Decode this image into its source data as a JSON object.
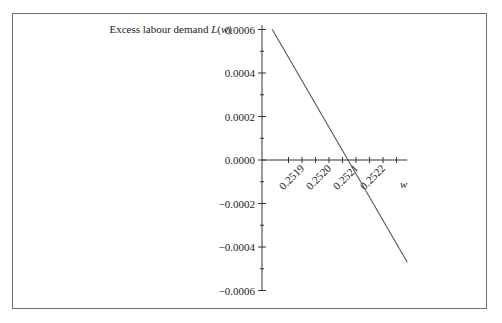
{
  "chart_data": {
    "type": "line",
    "title": "",
    "ylabel": "Excess labour demand L(w)",
    "ylabel_parts": {
      "text": "Excess labour demand ",
      "italic": "L",
      "paren_open": "(",
      "var": "w",
      "paren_close": ")"
    },
    "xlabel": "w",
    "x_ticks": [
      "0.2519",
      "0.2520",
      "0.2521",
      "0.2522"
    ],
    "x_tick_values": [
      0.2519,
      0.252,
      0.2521,
      0.2522
    ],
    "y_ticks": [
      "0.0006",
      "0.0004",
      "0.0002",
      "0.0000",
      "−0.0002",
      "−0.0004",
      "−0.0006"
    ],
    "y_tick_values": [
      0.0006,
      0.0004,
      0.0002,
      0.0,
      -0.0002,
      -0.0004,
      -0.0006
    ],
    "xlim": [
      0.25179,
      0.25229
    ],
    "ylim": [
      -0.0006,
      0.0006
    ],
    "grid": false,
    "legend": null,
    "series": [
      {
        "name": "L(w)",
        "x": [
          0.25179,
          0.25229
        ],
        "y": [
          0.0006,
          -0.00047
        ]
      }
    ],
    "annotations": [
      {
        "type": "zero_crossing",
        "x": 0.252015,
        "y": 0.0
      }
    ],
    "colors": {
      "line": "#555555",
      "axis": "#333333",
      "frame": "#6e6e6e"
    }
  }
}
